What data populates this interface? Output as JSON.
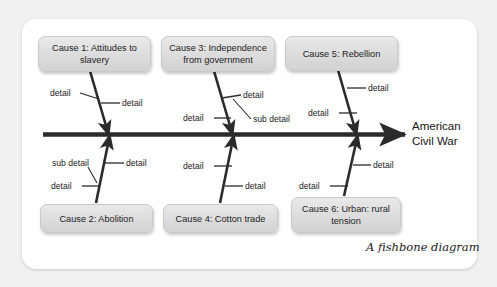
{
  "diagram": {
    "caption": "A fishbone diagram",
    "effect": {
      "line1": "American",
      "line2": "Civil War"
    },
    "colors": {
      "page_background": "#f1f1f1",
      "card_background": "#ffffff",
      "box_fill": "#dcdcdc",
      "box_border": "#c9c9c9",
      "bone_stroke": "#2b2b2b",
      "text": "#1c1c1c"
    },
    "causes": [
      {
        "id": "cause-1",
        "label": "Cause 1: Attitudes to slavery",
        "side": "top",
        "details": [
          {
            "id": "c1-d1",
            "label": "detail"
          },
          {
            "id": "c1-d2",
            "label": "detail"
          }
        ]
      },
      {
        "id": "cause-2",
        "label": "Cause 2: Abolition",
        "side": "bottom",
        "details": [
          {
            "id": "c2-d1",
            "label": "detail"
          },
          {
            "id": "c2-d2",
            "label": "detail"
          },
          {
            "id": "c2-sub1",
            "label": "sub detail"
          }
        ]
      },
      {
        "id": "cause-3",
        "label": "Cause 3: Independence from government",
        "side": "top",
        "details": [
          {
            "id": "c3-d1",
            "label": "detail"
          },
          {
            "id": "c3-d2",
            "label": "detail"
          },
          {
            "id": "c3-sub1",
            "label": "sub detail"
          }
        ]
      },
      {
        "id": "cause-4",
        "label": "Cause 4: Cotton trade",
        "side": "bottom",
        "details": [
          {
            "id": "c4-d1",
            "label": "detail"
          },
          {
            "id": "c4-d2",
            "label": "detail"
          }
        ]
      },
      {
        "id": "cause-5",
        "label": "Cause 5: Rebellion",
        "side": "top",
        "details": [
          {
            "id": "c5-d1",
            "label": "detail"
          },
          {
            "id": "c5-d2",
            "label": "detail"
          }
        ]
      },
      {
        "id": "cause-6",
        "label": "Cause 6: Urban: rural tension",
        "side": "bottom",
        "details": [
          {
            "id": "c6-d1",
            "label": "detail"
          },
          {
            "id": "c6-d2",
            "label": "detail"
          }
        ]
      }
    ]
  }
}
